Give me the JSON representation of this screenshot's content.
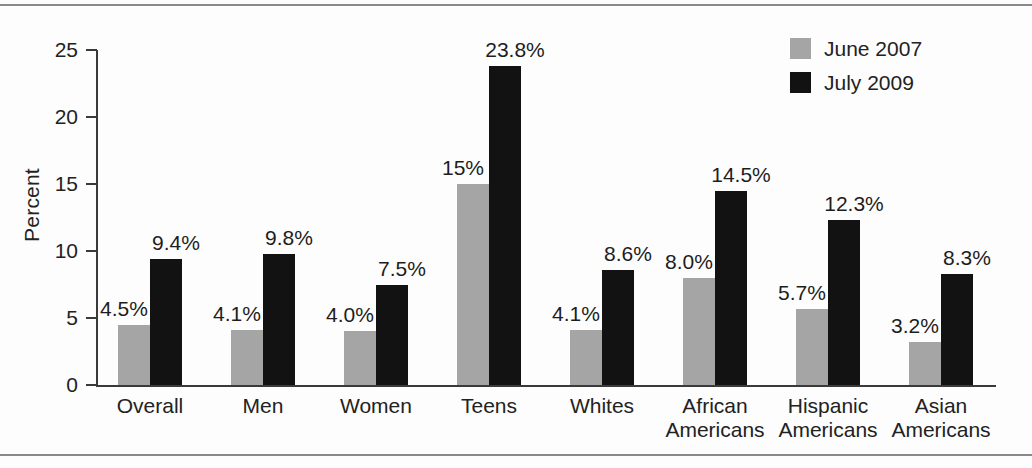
{
  "figure": {
    "has_top_rule": true,
    "has_bottom_rule": true
  },
  "legend": {
    "position": "top-right",
    "entries": [
      {
        "label": "June 2007",
        "color": "#a5a5a5",
        "swatch_name": "legend-swatch-june-2007"
      },
      {
        "label": "July 2009",
        "color": "#121212",
        "swatch_name": "legend-swatch-july-2009"
      }
    ]
  },
  "axes": {
    "y_title": "Percent",
    "y_ticks": [
      "0",
      "5",
      "10",
      "15",
      "20",
      "25"
    ]
  },
  "chart_data": {
    "type": "bar",
    "title": "",
    "subtitle": "",
    "xlabel": "",
    "ylabel": "Percent",
    "ylim": [
      0,
      25
    ],
    "ytick_values": [
      0,
      5,
      10,
      15,
      20,
      25
    ],
    "grid": false,
    "legend_position": "top-right",
    "categories": [
      "Overall",
      "Men",
      "Women",
      "Teens",
      "Whites",
      "African Americans",
      "Hispanic Americans",
      "Asian Americans"
    ],
    "category_lines": [
      [
        "Overall",
        ""
      ],
      [
        "Men",
        ""
      ],
      [
        "Women",
        ""
      ],
      [
        "Teens",
        ""
      ],
      [
        "Whites",
        ""
      ],
      [
        "African",
        "Americans"
      ],
      [
        "Hispanic",
        "Americans"
      ],
      [
        "Asian",
        "Americans"
      ]
    ],
    "series": [
      {
        "name": "June 2007",
        "color": "#a5a5a5",
        "values": [
          4.5,
          4.1,
          4.0,
          15.0,
          4.1,
          8.0,
          5.7,
          3.2
        ],
        "data_labels": [
          "4.5%",
          "4.1%",
          "4.0%",
          "15%",
          "4.1%",
          "8.0%",
          "5.7%",
          "3.2%"
        ]
      },
      {
        "name": "July 2009",
        "color": "#121212",
        "values": [
          9.4,
          9.8,
          7.5,
          23.8,
          8.6,
          14.5,
          12.3,
          8.3
        ],
        "data_labels": [
          "9.4%",
          "9.8%",
          "7.5%",
          "23.8%",
          "8.6%",
          "14.5%",
          "12.3%",
          "8.3%"
        ]
      }
    ]
  }
}
